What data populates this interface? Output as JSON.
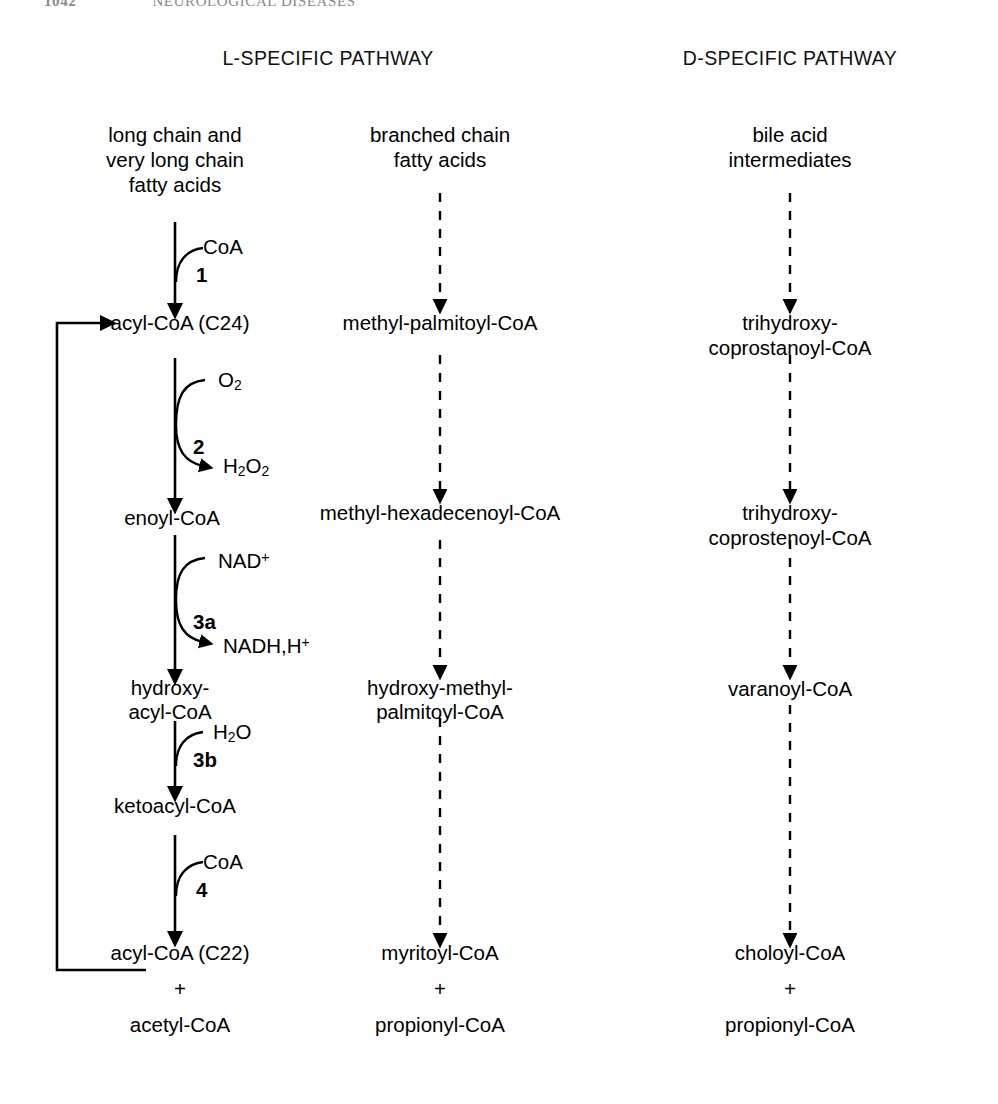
{
  "page": {
    "running_head": {
      "folio": "1042",
      "title": "NEUROLOGICAL DISEASES"
    },
    "width": 998,
    "height": 1104,
    "ink_color": "#000000",
    "background_color": "#ffffff"
  },
  "headers": {
    "left": "L-SPECIFIC PATHWAY",
    "right": "D-SPECIFIC PATHWAY"
  },
  "columns": {
    "left": {
      "name": "l-specific-column",
      "substrate": "long chain and\nvery long chain\nfatty acids",
      "nodes": [
        "acyl-CoA (C24)",
        "enoyl-CoA",
        "hydroxy-\nacyl-CoA",
        "ketoacyl-CoA",
        "acyl-CoA (C22)",
        "+",
        "acetyl-CoA"
      ]
    },
    "middle": {
      "name": "branched-chain-column",
      "substrate": "branched chain\nfatty acids",
      "nodes": [
        "methyl-palmitoyl-CoA",
        "methyl-hexadecenoyl-CoA",
        "hydroxy-methyl-\npalmitoyl-CoA",
        "myritoyl-CoA",
        "+",
        "propionyl-CoA"
      ]
    },
    "right": {
      "name": "d-specific-column",
      "substrate": "bile acid\nintermediates",
      "nodes": [
        "trihydroxy-coprostanoyl-CoA",
        "trihydroxy-coprostenoyl-CoA",
        "varanoyl-CoA",
        "choloyl-CoA",
        "+",
        "propionyl-CoA"
      ]
    }
  },
  "reactions": [
    {
      "id": "step-1",
      "number": "1",
      "substrate_in": "CoA",
      "substrate_out": "",
      "from": "long chain and very long chain fatty acids",
      "to": "acyl-CoA (C24)"
    },
    {
      "id": "step-2",
      "number": "2",
      "substrate_in": "O2",
      "substrate_out": "H2O2",
      "from": "acyl-CoA (C24)",
      "to": "enoyl-CoA"
    },
    {
      "id": "step-3a",
      "number": "3a",
      "substrate_in": "NAD+",
      "substrate_out": "NADH,H+",
      "from": "enoyl-CoA",
      "to": "hydroxy-acyl-CoA"
    },
    {
      "id": "step-3b",
      "number": "3b",
      "substrate_in": "H2O",
      "substrate_out": "",
      "from": "hydroxy-acyl-CoA",
      "to": "ketoacyl-CoA"
    },
    {
      "id": "step-4",
      "number": "4",
      "substrate_in": "CoA",
      "substrate_out": "",
      "from": "ketoacyl-CoA",
      "to": "acyl-CoA (C22)"
    }
  ],
  "cofactor_labels": {
    "coa_1": "CoA",
    "o2": "O",
    "o2_sub": "2",
    "h2o2_h": "H",
    "h2o2_sub1": "2",
    "h2o2_o": "O",
    "h2o2_sub2": "2",
    "nad_plus": "NAD",
    "nad_sup": "+",
    "nadh_text": "NADH,H",
    "nadh_sup": "+",
    "h2o_h": "H",
    "h2o_sub": "2",
    "h2o_o": "O",
    "coa_4": "CoA"
  },
  "recycle_loop": {
    "name": "acyl-coa-recycle-loop",
    "from": "acyl-CoA (C22)",
    "to": "acyl-CoA (C24)",
    "style": "solid"
  },
  "arrow_styles": {
    "left_column": "solid",
    "middle_column": "dashed",
    "right_column": "dashed"
  }
}
